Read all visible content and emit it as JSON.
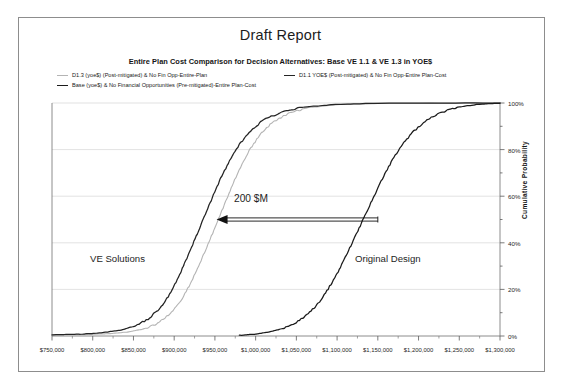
{
  "document": {
    "title": "Draft Report",
    "subtitle": "Entire Plan Cost Comparison for Decision Alternatives: Base VE 1.1 & VE 1.3 in YOE$"
  },
  "legend": {
    "items": [
      {
        "label": "D1.3 (yoe$) (Post-mitigated) & No Fin Opp-Entire-Plan",
        "color": "#b4b4b4",
        "swatch": "line-gray"
      },
      {
        "label": "D1.1 YOE$ (Post-mitigated) & No Fin Opp-Entire Plan-Cost",
        "color": "#242424",
        "swatch": "line-dark"
      },
      {
        "label": "Base (yoe$) & No Financial Opportunities (Pre-mitigated)-Entire Plan-Cost",
        "color": "#1b1b1b",
        "swatch": "line-black"
      }
    ]
  },
  "annotations": {
    "left_region": "VE Solutions",
    "right_region": "Original Design",
    "delta": "200 $M"
  },
  "chart_data": {
    "type": "line",
    "title": "Draft Report",
    "subtitle": "Entire Plan Cost Comparison for Decision Alternatives: Base VE 1.1 & VE 1.3 in YOE$",
    "xlabel": "",
    "ylabel": "Cumulative Probability",
    "xlim": [
      750000,
      1300000
    ],
    "ylim": [
      0,
      1
    ],
    "grid": "horizontal-major",
    "legend_position": "top-left",
    "x_ticks": [
      750000,
      800000,
      850000,
      900000,
      950000,
      1000000,
      1050000,
      1100000,
      1150000,
      1200000,
      1250000,
      1300000
    ],
    "x_tick_labels": [
      "$750,000",
      "$800,000",
      "$850,000",
      "$900,000",
      "$950,000",
      "$1,000,000",
      "$1,050,000",
      "$1,100,000",
      "$1,150,000",
      "$1,200,000",
      "$1,250,000",
      "$1,300,000"
    ],
    "y_ticks": [
      0,
      0.2,
      0.4,
      0.6,
      0.8,
      1.0
    ],
    "y_tick_labels": [
      "0%",
      "20%",
      "40%",
      "60%",
      "80%",
      "100%"
    ],
    "y_minor_ticks": [
      0.1,
      0.3,
      0.5,
      0.7,
      0.9
    ],
    "series": [
      {
        "name": "D1.3 (yoe$) (Post-mitigated) & No Fin Opp-Entire-Plan",
        "color": "#b4b4b4",
        "width": 1.1,
        "x": [
          750000,
          790000,
          820000,
          845000,
          865000,
          880000,
          895000,
          908000,
          920000,
          930000,
          940000,
          950000,
          960000,
          970000,
          980000,
          992000,
          1005000,
          1020000,
          1040000,
          1065000,
          1100000,
          1150000,
          1300000
        ],
        "y": [
          0.004,
          0.006,
          0.01,
          0.018,
          0.032,
          0.055,
          0.095,
          0.15,
          0.225,
          0.3,
          0.38,
          0.465,
          0.55,
          0.635,
          0.715,
          0.795,
          0.862,
          0.915,
          0.955,
          0.98,
          0.993,
          0.998,
          1.0
        ]
      },
      {
        "name": "D1.1 YOE$ (Post-mitigated) & No Fin Opp-Entire Plan-Cost",
        "color": "#242424",
        "width": 1.25,
        "x": [
          750000,
          785000,
          812000,
          835000,
          855000,
          870000,
          884000,
          896000,
          907000,
          917000,
          927000,
          937000,
          947000,
          957000,
          968000,
          980000,
          994000,
          1010000,
          1032000,
          1060000,
          1098000,
          1150000,
          1300000
        ],
        "y": [
          0.005,
          0.008,
          0.014,
          0.026,
          0.046,
          0.078,
          0.125,
          0.188,
          0.265,
          0.345,
          0.428,
          0.512,
          0.595,
          0.676,
          0.752,
          0.822,
          0.882,
          0.928,
          0.962,
          0.983,
          0.994,
          0.999,
          1.0
        ]
      },
      {
        "name": "Base (yoe$) & No Financial Opportunities (Pre-mitigated)-Entire Plan-Cost",
        "color": "#1b1b1b",
        "width": 1.25,
        "x": [
          980000,
          1000000,
          1018000,
          1035000,
          1050000,
          1063000,
          1075000,
          1086000,
          1097000,
          1107000,
          1117000,
          1127000,
          1137000,
          1147000,
          1157000,
          1168000,
          1180000,
          1193000,
          1208000,
          1226000,
          1248000,
          1275000,
          1300000
        ],
        "y": [
          0.003,
          0.008,
          0.018,
          0.034,
          0.058,
          0.09,
          0.132,
          0.185,
          0.248,
          0.315,
          0.388,
          0.462,
          0.538,
          0.612,
          0.685,
          0.756,
          0.82,
          0.875,
          0.922,
          0.958,
          0.982,
          0.995,
          0.999
        ]
      }
    ],
    "annotations": [
      {
        "text": "VE Solutions",
        "x": 838000,
        "y": 0.34,
        "type": "text"
      },
      {
        "text": "Original Design",
        "x": 1165000,
        "y": 0.34,
        "type": "text"
      },
      {
        "text": "200 $M",
        "x": 1048000,
        "y": 0.565,
        "type": "text"
      },
      {
        "text": "",
        "type": "arrow",
        "x_from": 1150000,
        "x_to": 952000,
        "y": 0.5,
        "direction": "left"
      }
    ]
  }
}
